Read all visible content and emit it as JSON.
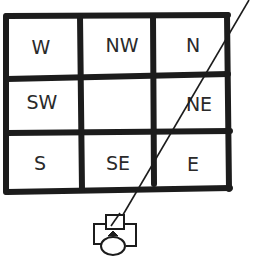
{
  "diagram": {
    "grid": {
      "rows": [
        [
          "W",
          "NW",
          "N"
        ],
        [
          "SW",
          "",
          "NE"
        ],
        [
          "S",
          "SE",
          "E"
        ]
      ]
    },
    "figure": "person-at-desk-icon",
    "line": "sight-line"
  }
}
